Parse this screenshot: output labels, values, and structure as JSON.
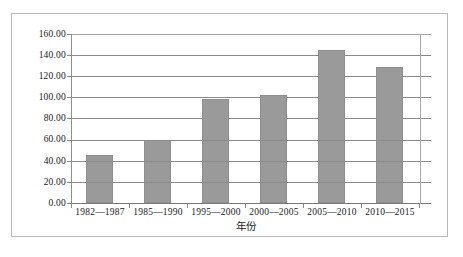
{
  "chart_data": {
    "type": "bar",
    "title": "",
    "xlabel": "年份",
    "ylabel": "",
    "categories": [
      "1982—1987",
      "1985—1990",
      "1995—2000",
      "2000—2005",
      "2005—2010",
      "2010—2015"
    ],
    "values": [
      45,
      60,
      98,
      102,
      145,
      129
    ],
    "value_labels": [
      "45.00",
      "60.00",
      "98.00",
      "102.00",
      "145.00",
      "129.00"
    ],
    "ylim": [
      0,
      160
    ],
    "ytick_step": 20,
    "ytick_labels": [
      "160.00",
      "140.00",
      "120.00",
      "100.00",
      "80.00",
      "60.00",
      "40.00",
      "20.00",
      "0.00"
    ],
    "ytick_values": [
      160,
      140,
      120,
      100,
      80,
      60,
      40,
      20,
      0
    ],
    "grid": true,
    "grid_axis": "y",
    "legend": false,
    "legend_position": "none",
    "series": [
      {
        "name": "",
        "values": [
          45,
          60,
          98,
          102,
          145,
          129
        ]
      }
    ],
    "colors": {
      "bar_fill": "#9a9a9a",
      "bar_edge": "#8e8e8e",
      "gridline": "#8a8a8a",
      "axis": "#8d8d8d",
      "text": "#1a1a1a",
      "frame": "#b9b9b9",
      "background": "#ffffff"
    }
  }
}
